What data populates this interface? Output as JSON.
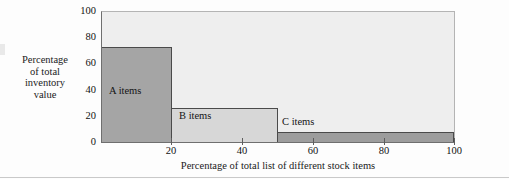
{
  "chart_data": {
    "type": "bar",
    "title": "",
    "subtitle": "",
    "xlabel": "Percentage of total list of different stock items",
    "ylabel": "Percentage of total inventory value",
    "ylabel_lines": [
      "Percentage",
      "of total",
      "inventory",
      "value"
    ],
    "xlim": [
      0,
      100
    ],
    "ylim": [
      0,
      100
    ],
    "grid": false,
    "legend": "none",
    "xticks": [
      20,
      40,
      60,
      80,
      100
    ],
    "xtick_labels": [
      "20",
      "40",
      "60",
      "80",
      "100"
    ],
    "yticks": [
      0,
      20,
      40,
      60,
      80,
      100
    ],
    "ytick_labels": [
      "0",
      "20",
      "40",
      "60",
      "80",
      "100"
    ],
    "categories": [
      "A items",
      "B items",
      "C items"
    ],
    "values": [
      73,
      26,
      8
    ],
    "bars": [
      {
        "label": "A items",
        "x_start": 0,
        "x_end": 20,
        "value": 73,
        "color": "#a5a5a5"
      },
      {
        "label": "B items",
        "x_start": 20,
        "x_end": 50,
        "value": 26,
        "color": "#d7d7d7"
      },
      {
        "label": "C items",
        "x_start": 50,
        "x_end": 100,
        "value": 8,
        "color": "#9d9d9d"
      }
    ],
    "colors": {
      "plot_background": "#eeeeee",
      "page_background": "#fdfdfd",
      "bar_outline": "#4a4a4a",
      "axis": "#6f6f6f",
      "text": "#141414"
    }
  }
}
